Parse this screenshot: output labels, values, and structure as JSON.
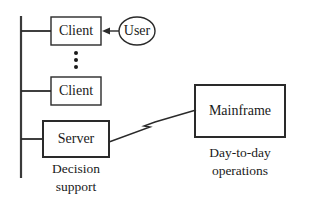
{
  "diagram": {
    "nodes": {
      "client1": {
        "label": "Client"
      },
      "user": {
        "label": "User"
      },
      "client2": {
        "label": "Client"
      },
      "server": {
        "label": "Server"
      },
      "mainframe": {
        "label": "Mainframe"
      }
    },
    "captions": {
      "server_line1": "Decision",
      "server_line2": "support",
      "mainframe_line1": "Day-to-day",
      "mainframe_line2": "operations"
    },
    "edges": [
      {
        "from": "user",
        "to": "client1",
        "type": "arrow"
      },
      {
        "from": "bus",
        "to": "client1",
        "type": "line"
      },
      {
        "from": "bus",
        "to": "client2",
        "type": "line"
      },
      {
        "from": "bus",
        "to": "server",
        "type": "line"
      },
      {
        "from": "server",
        "to": "mainframe",
        "type": "zigzag-link"
      }
    ],
    "ellipsis": "vertical-dots",
    "colors": {
      "stroke": "#2a2a2a",
      "background": "#ffffff"
    }
  }
}
